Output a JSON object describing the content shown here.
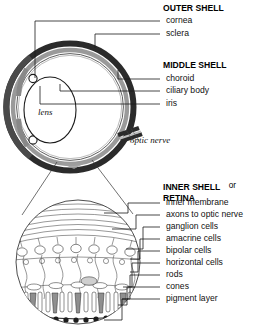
{
  "diagram": {
    "figure_labels": {
      "lens": "lens",
      "optic_nerve": "optic nerve"
    },
    "colors": {
      "sclera": "#2b2b2b",
      "cornea": "#6e6e6e",
      "choroid": "#9a9a9a",
      "ciliary_body": "#8a8a8a",
      "iris": "#555555",
      "background": "#ffffff",
      "text": "#111111",
      "leader_line": "#1a1a1a",
      "pigment_layer": "#1c1c1c",
      "cone_fill": "#8f8f8f"
    },
    "groups": [
      {
        "id": "outer-shell",
        "heading": "OUTER SHELL",
        "items": [
          {
            "id": "cornea",
            "label": "cornea"
          },
          {
            "id": "sclera",
            "label": "sclera"
          }
        ]
      },
      {
        "id": "middle-shell",
        "heading": "MIDDLE SHELL",
        "items": [
          {
            "id": "choroid",
            "label": "choroid"
          },
          {
            "id": "ciliary-body",
            "label": "ciliary body"
          },
          {
            "id": "iris",
            "label": "iris"
          }
        ]
      },
      {
        "id": "inner-shell",
        "heading": "INNER SHELL",
        "heading_conjunction": "or",
        "heading_line2": "RETINA",
        "items": [
          {
            "id": "inner-membrane",
            "label": "inner membrane"
          },
          {
            "id": "axons-to-optic-nerve",
            "label": "axons to optic nerve"
          },
          {
            "id": "ganglion-cells",
            "label": "ganglion cells"
          },
          {
            "id": "amacrine-cells",
            "label": "amacrine cells"
          },
          {
            "id": "bipolar-cells",
            "label": "bipolar cells"
          },
          {
            "id": "horizontal-cells",
            "label": "horizontal cells"
          },
          {
            "id": "rods",
            "label": "rods"
          },
          {
            "id": "cones",
            "label": "cones"
          },
          {
            "id": "pigment-layer",
            "label": "pigment layer"
          }
        ]
      }
    ]
  }
}
